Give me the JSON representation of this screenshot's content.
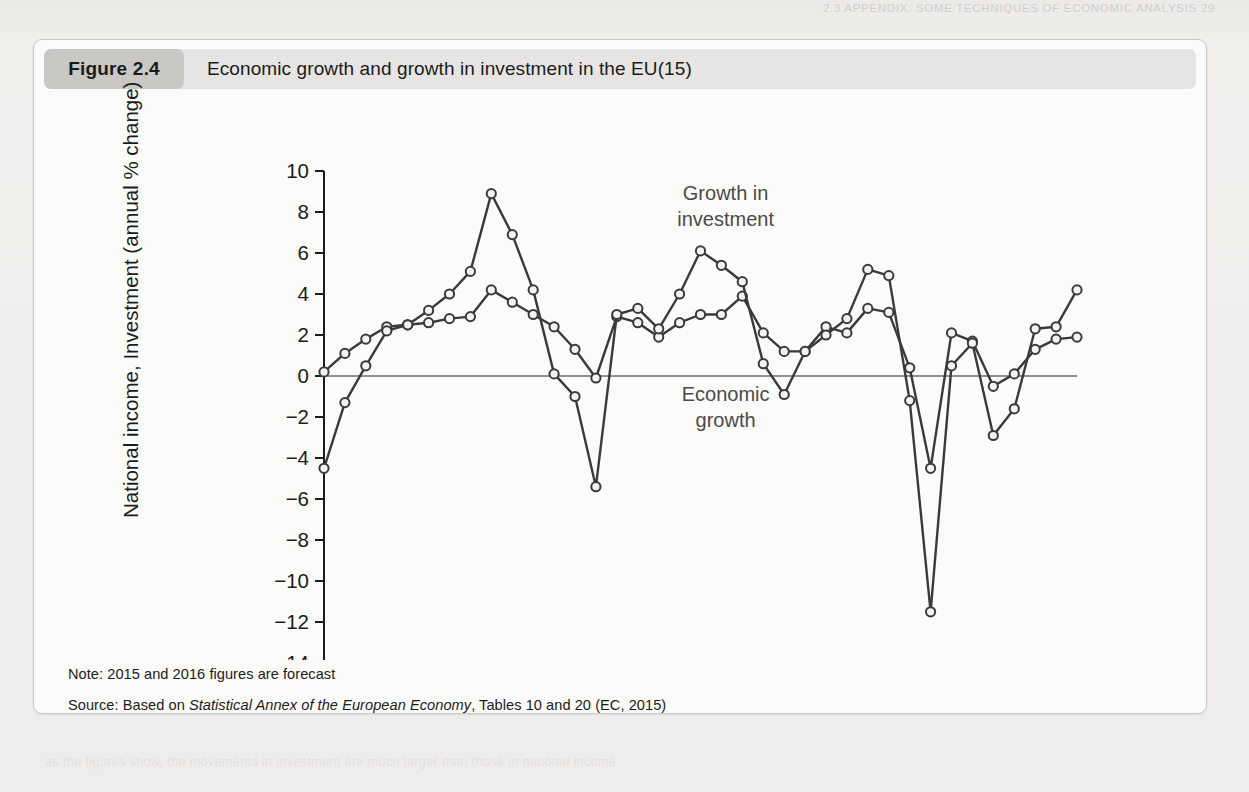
{
  "page": {
    "running_head": "2.3 APPENDIX: SOME TECHNIQUES OF ECONOMIC ANALYSIS  29",
    "ghosts": [
      "the  most  likely  rate  and  the  most  likely  value  of  the  output  in  the  coming  year",
      "it is difficult to predict the point at which",
      "a change in the rate of growth will occur",
      "and how large the change will be",
      "so the",
      "as the figures show, the movements in investment are much larger than those in national income"
    ]
  },
  "figure": {
    "tag": "Figure 2.4",
    "title": "Economic growth and growth in investment in the EU(15)",
    "note": "Note: 2015 and 2016 figures are forecast",
    "source_prefix": "Source: Based on ",
    "source_italic": "Statistical Annex of the European Economy",
    "source_suffix": ", Tables 10 and 20 (EC, 2015)"
  },
  "chart_data": {
    "type": "line",
    "title": "Economic growth and growth in investment in the EU(15)",
    "xlabel": "",
    "ylabel": "National income, Investment (annual % change)",
    "xlim": [
      1980,
      2016
    ],
    "ylim": [
      -14,
      10
    ],
    "yticks": [
      10,
      8,
      6,
      4,
      2,
      0,
      -2,
      -4,
      -6,
      -8,
      -10,
      -12,
      -14
    ],
    "ytick_labels": [
      "10",
      "8",
      "6",
      "4",
      "2",
      "0",
      "−2",
      "−4",
      "−6",
      "−8",
      "−10",
      "−12",
      "−14"
    ],
    "xticks": [
      1980,
      1985,
      1990,
      1995,
      2000,
      2005,
      2010,
      2015
    ],
    "xtick_labels": [
      "1980",
      "1985",
      "1990",
      "1995",
      "2000",
      "2005",
      "2010",
      "2015"
    ],
    "minor_xtick_step": 1,
    "grid": false,
    "zero_line": true,
    "legend": "annotations",
    "annotations": [
      {
        "text_lines": [
          "Growth in",
          "investment"
        ],
        "x": 1999.2,
        "y": 8.6
      },
      {
        "text_lines": [
          "Economic",
          "growth"
        ],
        "x": 1999.2,
        "y": -1.2
      }
    ],
    "x": [
      1980,
      1981,
      1982,
      1983,
      1984,
      1985,
      1986,
      1987,
      1988,
      1989,
      1990,
      1991,
      1992,
      1993,
      1994,
      1995,
      1996,
      1997,
      1998,
      1999,
      2000,
      2001,
      2002,
      2003,
      2004,
      2005,
      2006,
      2007,
      2008,
      2009,
      2010,
      2011,
      2012,
      2013,
      2014,
      2015,
      2016
    ],
    "series": [
      {
        "name": "Economic growth",
        "color": "#3a3a3a",
        "marker": "circle-open",
        "values": [
          0.2,
          1.1,
          1.8,
          2.4,
          2.5,
          2.6,
          2.8,
          2.9,
          4.2,
          3.6,
          3.0,
          2.4,
          1.3,
          -0.1,
          2.9,
          2.6,
          1.9,
          2.6,
          3.0,
          3.0,
          3.9,
          2.1,
          1.2,
          1.2,
          2.4,
          2.1,
          3.3,
          3.1,
          0.4,
          -4.5,
          2.1,
          1.7,
          -0.5,
          0.1,
          1.3,
          1.8,
          1.9
        ]
      },
      {
        "name": "Growth in investment",
        "color": "#3a3a3a",
        "marker": "circle-open",
        "values": [
          -4.5,
          -1.3,
          0.5,
          2.2,
          2.5,
          3.2,
          4.0,
          5.1,
          8.9,
          6.9,
          4.2,
          0.1,
          -1.0,
          -5.4,
          3.0,
          3.3,
          2.3,
          4.0,
          6.1,
          5.4,
          4.6,
          0.6,
          -0.9,
          1.2,
          2.0,
          2.8,
          5.2,
          4.9,
          -1.2,
          -11.5,
          0.5,
          1.6,
          -2.9,
          -1.6,
          2.3,
          2.4,
          4.2
        ]
      }
    ]
  }
}
